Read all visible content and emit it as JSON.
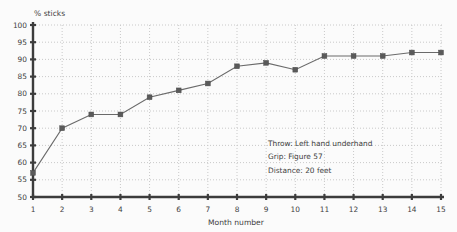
{
  "chart_data": {
    "type": "line",
    "title": "",
    "ylabel": "% sticks",
    "xlabel": "Month number",
    "x": [
      1,
      2,
      3,
      4,
      5,
      6,
      7,
      8,
      9,
      10,
      11,
      12,
      13,
      14,
      15
    ],
    "values": [
      57,
      70,
      74,
      74,
      79,
      81,
      83,
      88,
      89,
      87,
      91,
      91,
      91,
      92,
      92
    ],
    "ylim": [
      50,
      100
    ],
    "ytick_step": 5,
    "yticks": [
      50,
      55,
      60,
      65,
      70,
      75,
      80,
      85,
      90,
      95,
      100
    ],
    "grid": "dotted, horizontal every 5 units and vertical every month",
    "legend_position": "none",
    "marker": "filled-square",
    "annotations": [
      "Throw: Left hand underhand",
      "Grip: Figure 57",
      "Distance: 20 feet"
    ],
    "colors": {
      "line": "#6a6a6a",
      "marker": "#5a5a5a",
      "axis": "#3c3c3c",
      "grid": "#c9c9c9",
      "text": "#3f3f3f",
      "background": "#fbfbfb"
    }
  }
}
